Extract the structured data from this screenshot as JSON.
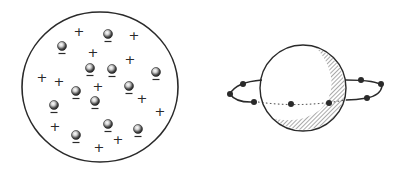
{
  "figure": {
    "colors": {
      "ink": "#2a2a2a",
      "background": "#ffffff",
      "hatch": "#555555",
      "electron_highlight": "#ffffff",
      "electron_fill": "#3a3a3a"
    }
  },
  "thomson_model": {
    "label": "plum-pudding-atom",
    "circle": {
      "cx": 100,
      "cy": 87,
      "rx": 78,
      "ry": 75
    },
    "plus_sign": "+",
    "minus_sign": "–",
    "positive_charges": [
      [
        79,
        31
      ],
      [
        134,
        35
      ],
      [
        93,
        52
      ],
      [
        130,
        59
      ],
      [
        42,
        77
      ],
      [
        59,
        81
      ],
      [
        98,
        86
      ],
      [
        142,
        98
      ],
      [
        160,
        111
      ],
      [
        55,
        126
      ],
      [
        118,
        139
      ],
      [
        99,
        147
      ]
    ],
    "electrons": [
      [
        108,
        34
      ],
      [
        62,
        46
      ],
      [
        90,
        68
      ],
      [
        112,
        69
      ],
      [
        156,
        72
      ],
      [
        129,
        86
      ],
      [
        76,
        91
      ],
      [
        95,
        101
      ],
      [
        54,
        105
      ],
      [
        108,
        124
      ],
      [
        138,
        129
      ],
      [
        76,
        135
      ]
    ]
  },
  "rutherford_model": {
    "label": "planetary-atom",
    "nucleus": {
      "cx": 303,
      "cy": 88,
      "r": 43
    },
    "orbit": {
      "cx": 305,
      "cy": 92,
      "rx": 78,
      "ry": 11
    },
    "electrons": [
      [
        243,
        84
      ],
      [
        230,
        94
      ],
      [
        254,
        102
      ],
      [
        291,
        104
      ],
      [
        329,
        103
      ],
      [
        361,
        80
      ],
      [
        381,
        84
      ],
      [
        367,
        98
      ]
    ]
  }
}
